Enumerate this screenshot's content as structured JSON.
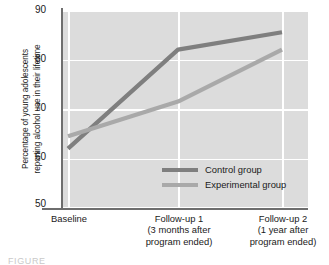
{
  "chart_data": {
    "type": "line",
    "title": "",
    "xlabel": "",
    "ylabel": "Percentage of young adolescents reporting alcohol use in their lifetime",
    "ylabel_lines": [
      "Percentage of young adolescents",
      "reporting alcohol use in their lifetime"
    ],
    "categories": [
      "Baseline",
      "Follow-up 1",
      "Follow-up 2"
    ],
    "category_sublabels": [
      [],
      [
        "(3 months after",
        "program ended)"
      ],
      [
        "(1 year after",
        "program ended)"
      ]
    ],
    "series": [
      {
        "name": "Control group",
        "values": [
          62,
          82,
          85.5
        ],
        "color": "#7f7f7f"
      },
      {
        "name": "Experimental group",
        "values": [
          64.5,
          71.5,
          82
        ],
        "color": "#a9a9a9"
      }
    ],
    "ylim": [
      50,
      90
    ],
    "yticks": [
      90,
      80,
      70,
      60,
      50
    ],
    "ytick_labels": [
      "90",
      "80",
      "70",
      "60",
      "50"
    ],
    "grid": true,
    "grid_color": "#ffffff",
    "plot_background": "#dcdcdc",
    "axis_color": "#6e6e6e",
    "legend_position": "inside-lower-center"
  },
  "legend": {
    "entries": [
      {
        "label": "Control group",
        "color": "#7f7f7f"
      },
      {
        "label": "Experimental group",
        "color": "#a9a9a9"
      }
    ]
  },
  "caption": {
    "text": "FIGURE"
  }
}
